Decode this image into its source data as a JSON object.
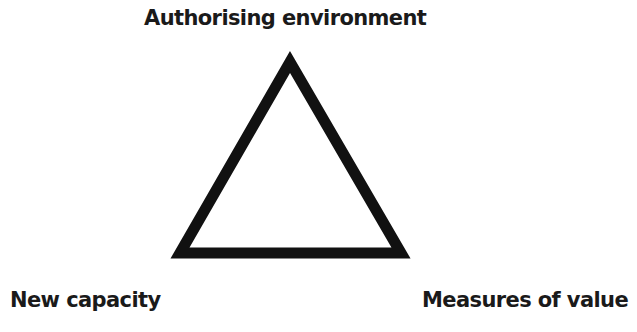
{
  "diagram": {
    "type": "strategic-triangle",
    "nodes": {
      "top": "Authorising environment",
      "bottom_left": "New capacity",
      "bottom_right": "Measures of value"
    },
    "shape": {
      "kind": "triangle-outline",
      "stroke_color": "#111111",
      "fill_color": "#ffffff"
    }
  }
}
